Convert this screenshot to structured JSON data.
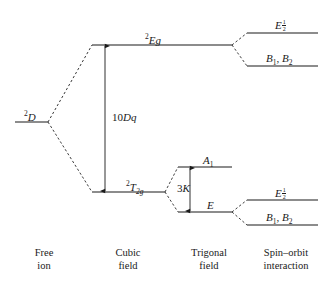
{
  "figure": {
    "type": "energy-level-splitting-diagram",
    "background_color": "#ffffff",
    "line_color": "#1a1a1a",
    "text_color": "#1a1a1a"
  },
  "columns": [
    {
      "id": "free-ion",
      "line1": "Free",
      "line2": "ion"
    },
    {
      "id": "cubic-field",
      "line1": "Cubic",
      "line2": "field"
    },
    {
      "id": "trigonal-field",
      "line1": "Trigonal",
      "line2": "field"
    },
    {
      "id": "spin-orbit",
      "line1": "Spin–orbit",
      "line2": "interaction"
    }
  ],
  "levels": [
    {
      "id": "free-ion-2D",
      "column": "free-ion",
      "label_text": "2D",
      "label_parts": {
        "superscript": "2",
        "letter": "D"
      },
      "x1": 15,
      "x2": 48,
      "y": 122,
      "label_x": 24,
      "label_y": 110
    },
    {
      "id": "cubic-2Eg",
      "column": "cubic-field",
      "label_text": "2Eg",
      "label_parts": {
        "superscript": "2",
        "letter": "E",
        "italic_tail": "g"
      },
      "x1": 92,
      "x2": 232,
      "y": 45,
      "label_x": 145,
      "label_y": 33
    },
    {
      "id": "cubic-2T2g",
      "column": "cubic-field",
      "label_text": "2T2g",
      "label_parts": {
        "superscript": "2",
        "letter": "T",
        "subscript": "2g"
      },
      "x1": 92,
      "x2": 165,
      "y": 192,
      "label_x": 126,
      "label_y": 180
    },
    {
      "id": "trigonal-A1",
      "column": "trigonal-field",
      "label_text": "A1",
      "label_parts": {
        "letter": "A",
        "subscript": "1"
      },
      "x1": 178,
      "x2": 232,
      "y": 167,
      "label_x": 203,
      "label_y": 155
    },
    {
      "id": "trigonal-E",
      "column": "trigonal-field",
      "label_text": "E",
      "label_parts": {
        "letter": "E"
      },
      "x1": 178,
      "x2": 232,
      "y": 212,
      "label_x": 207,
      "label_y": 200
    },
    {
      "id": "spinorbit-upper-Ehalf",
      "column": "spin-orbit",
      "label_text": "E 1/2",
      "label_parts": {
        "letter": "E",
        "subscript_fraction": "1/2"
      },
      "x1": 247,
      "x2": 318,
      "y": 33,
      "label_x": 275,
      "label_y": 19
    },
    {
      "id": "spinorbit-upper-B1B2",
      "column": "spin-orbit",
      "label_text": "B1, B2",
      "label_parts": {
        "letter": "B",
        "subscript": "1",
        "letter2": "B",
        "subscript2": "2"
      },
      "x1": 247,
      "x2": 318,
      "y": 66,
      "label_x": 266,
      "label_y": 53
    },
    {
      "id": "spinorbit-lower-Ehalf",
      "column": "spin-orbit",
      "label_text": "E 1/2",
      "label_parts": {
        "letter": "E",
        "subscript_fraction": "1/2"
      },
      "x1": 247,
      "x2": 318,
      "y": 200,
      "label_x": 275,
      "label_y": 187
    },
    {
      "id": "spinorbit-lower-B1B2",
      "column": "spin-orbit",
      "label_text": "B1, B2",
      "label_parts": {
        "letter": "B",
        "subscript": "1",
        "letter2": "B",
        "subscript2": "2"
      },
      "x1": 247,
      "x2": 318,
      "y": 225,
      "label_x": 266,
      "label_y": 212
    }
  ],
  "connectors": [
    {
      "id": "2D-to-2Eg",
      "x1": 48,
      "y1": 122,
      "x2": 92,
      "y2": 45
    },
    {
      "id": "2D-to-2T2g",
      "x1": 48,
      "y1": 122,
      "x2": 92,
      "y2": 192
    },
    {
      "id": "2T2g-to-A1",
      "x1": 165,
      "y1": 192,
      "x2": 178,
      "y2": 167
    },
    {
      "id": "2T2g-to-E",
      "x1": 165,
      "y1": 192,
      "x2": 178,
      "y2": 212
    },
    {
      "id": "2Eg-to-Ehalf",
      "x1": 232,
      "y1": 45,
      "x2": 247,
      "y2": 33
    },
    {
      "id": "2Eg-to-B1B2",
      "x1": 232,
      "y1": 45,
      "x2": 247,
      "y2": 66
    },
    {
      "id": "E-to-Ehalf",
      "x1": 232,
      "y1": 212,
      "x2": 247,
      "y2": 200
    },
    {
      "id": "E-to-B1B2",
      "x1": 232,
      "y1": 212,
      "x2": 247,
      "y2": 225
    }
  ],
  "measures": [
    {
      "id": "ten-Dq",
      "label_text": "10Dq",
      "label_parts": {
        "roman": "10",
        "italic": "Dq"
      },
      "x": 105,
      "y_top": 46,
      "y_bottom": 191,
      "label_x": 112,
      "label_y": 112,
      "arrowheads": "both"
    },
    {
      "id": "three-K",
      "label_text": "3K",
      "label_parts": {
        "roman": "3",
        "italic": "K"
      },
      "x": 190,
      "y_top": 168,
      "y_bottom": 211,
      "label_x": 177,
      "label_y": 183,
      "arrowheads": "both"
    }
  ],
  "captions": {
    "free_ion": {
      "line1": "Free",
      "line2": "ion",
      "x": 44,
      "y": 246
    },
    "cubic_field": {
      "line1": "Cubic",
      "line2": "field",
      "x": 128,
      "y": 246
    },
    "trigonal_field": {
      "line1": "Trigonal",
      "line2": "field",
      "x": 209,
      "y": 246
    },
    "spin_orbit": {
      "line1": "Spin–orbit",
      "line2": "interaction",
      "x": 286,
      "y": 246
    }
  }
}
